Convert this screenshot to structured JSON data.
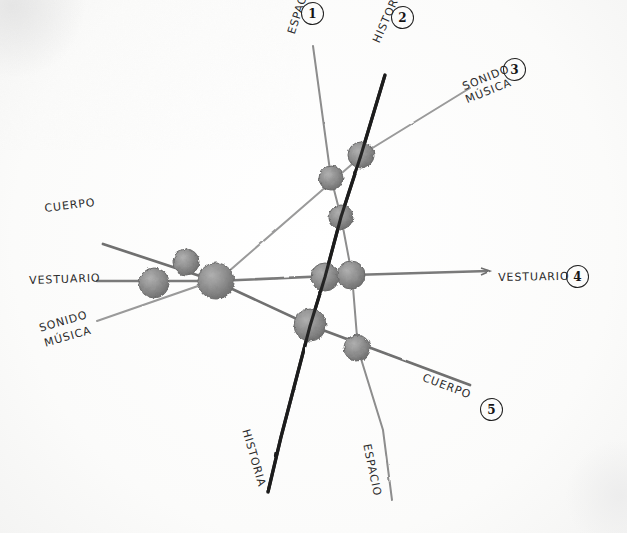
{
  "diagram": {
    "medium": "pencil on white paper",
    "axes": [
      {
        "id": "espacio",
        "number": "1",
        "top_label": "ESPACIO",
        "bottom_label": "ESPACIO",
        "stroke": "#8d8d8d",
        "width": 2.0
      },
      {
        "id": "historia",
        "number": "2",
        "top_label": "HISTORIA",
        "bottom_label": "HISTORIA",
        "stroke": "#1c1c1c",
        "width": 3.2
      },
      {
        "id": "sonido",
        "number": "3",
        "top_label": "SONIDO\nMÚSICA",
        "bottom_label": "SONIDO\nMÚSICA",
        "stroke": "#999999",
        "width": 2.0
      },
      {
        "id": "vestuario",
        "number": "4",
        "top_label": "VESTUARIO",
        "bottom_label": "VESTUARIO",
        "stroke": "#7a7a7a",
        "width": 2.6
      },
      {
        "id": "cuerpo",
        "number": "5",
        "top_label": "CUERPO",
        "bottom_label": "CUERPO",
        "stroke": "#6f6f6f",
        "width": 2.6
      }
    ],
    "labels": {
      "espacio_top": "ESPACIO",
      "historia_top": "HISTORIA",
      "sonido_top": "SONIDO",
      "musica_top": "MÚSICA",
      "cuerpo_left": "CUERPO",
      "vestuario_left": "VESTUARIO",
      "sonido_left": "SONIDO",
      "musica_left": "MÚSICA",
      "vestuario_right": "VESTUARIO",
      "cuerpo_right": "CUERPO",
      "historia_bottom": "HISTORIA",
      "espacio_bottom": "ESPACIO"
    },
    "numbers": {
      "one": "1",
      "two": "2",
      "three": "3",
      "four": "4",
      "five": "5"
    },
    "nodes": [
      {
        "name": "vestuario-sonido",
        "cx": 154,
        "cy": 283,
        "r": 15
      },
      {
        "name": "cuerpo-sonido",
        "cx": 186,
        "cy": 262,
        "r": 13
      },
      {
        "name": "cuerpo-vestuario",
        "cx": 216,
        "cy": 281,
        "r": 18
      },
      {
        "name": "espacio-sonido",
        "cx": 331,
        "cy": 178,
        "r": 12
      },
      {
        "name": "historia-sonido",
        "cx": 361,
        "cy": 155,
        "r": 13
      },
      {
        "name": "espacio-historia",
        "cx": 341,
        "cy": 217,
        "r": 12
      },
      {
        "name": "historia-vestuario",
        "cx": 325,
        "cy": 277,
        "r": 14
      },
      {
        "name": "espacio-vestuario",
        "cx": 351,
        "cy": 275,
        "r": 14
      },
      {
        "name": "historia-cuerpo",
        "cx": 310,
        "cy": 325,
        "r": 16
      },
      {
        "name": "espacio-cuerpo",
        "cx": 357,
        "cy": 348,
        "r": 13
      }
    ],
    "colors": {
      "paper": "#fdfdfd",
      "ink_dark": "#1c1c1c",
      "ink_gray": "#8d8d8d",
      "node_fill": "#8a8a8a"
    }
  }
}
